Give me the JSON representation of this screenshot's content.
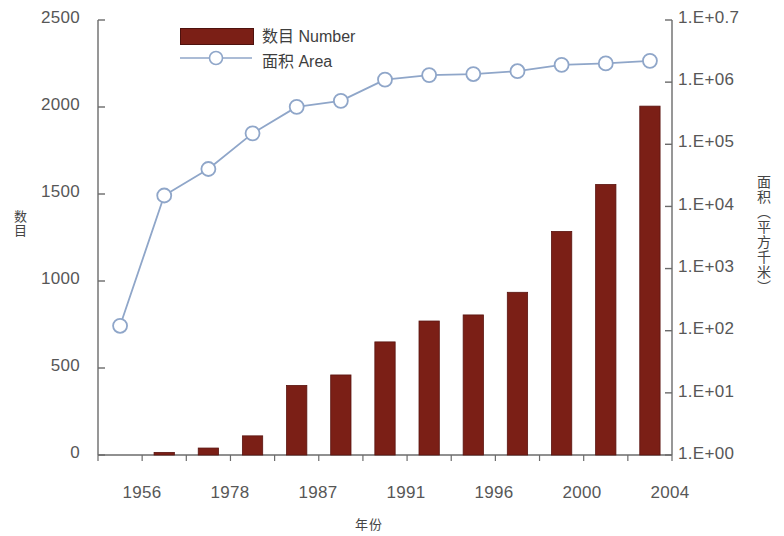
{
  "chart_data": {
    "type": "bar",
    "title": "",
    "subtitle": "",
    "xlabel": "年份",
    "ylabel": "数目",
    "y2label": "面积（平方千米）",
    "grid": false,
    "legend_position": "top-left",
    "categories": [
      "1956",
      "",
      "1978",
      "",
      "1987",
      "",
      "1991",
      "",
      "1996",
      "",
      "2000",
      "",
      "2004"
    ],
    "x_tick_labels": [
      "1956",
      "1978",
      "1987",
      "1991",
      "1996",
      "2000",
      "2004"
    ],
    "ylim": [
      0,
      2500
    ],
    "y_ticks": [
      "0",
      "500",
      "1000",
      "1500",
      "2000",
      "2500"
    ],
    "y2_scale": "log",
    "y2_ticks": [
      "1.E+00",
      "1.E+01",
      "1.E+02",
      "1.E+03",
      "1.E+04",
      "1.E+05",
      "1.E+06",
      "1.E+0.7"
    ],
    "y2lim": [
      1,
      10000000
    ],
    "series": [
      {
        "name": "数目 Number",
        "type": "bar",
        "axis": "left",
        "color": "#7B1F16",
        "values": [
          0,
          15,
          40,
          110,
          400,
          460,
          650,
          770,
          805,
          935,
          1285,
          1555,
          2005
        ]
      },
      {
        "name": "面积 Area",
        "type": "line",
        "axis": "right",
        "color": "#8fa6c9",
        "marker": "circle-open",
        "values": [
          120,
          15000,
          40000,
          150000,
          400000,
          500000,
          1100000,
          1300000,
          1350000,
          1500000,
          1900000,
          2000000,
          2200000
        ]
      }
    ]
  },
  "legend": {
    "items": [
      {
        "label": "数目 Number",
        "marker": "bar-swatch"
      },
      {
        "label": "面积 Area",
        "marker": "line-circle"
      }
    ]
  },
  "colors": {
    "bar": "#7B1F16",
    "bar_edge": "#5a1410",
    "line": "#8fa6c9",
    "marker_fill": "#ffffff",
    "axis": "#6b6b6b",
    "text": "#575757"
  }
}
